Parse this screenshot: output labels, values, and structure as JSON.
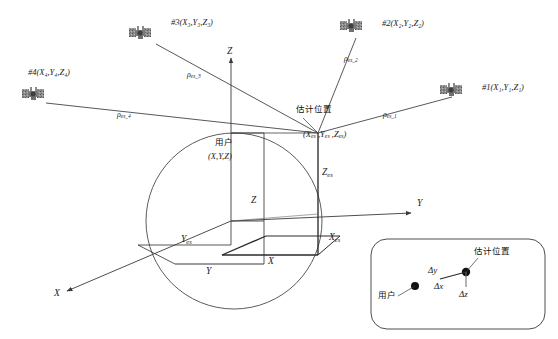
{
  "figure": {
    "type": "diagram",
    "background_color": "#ffffff",
    "line_color": "#3a3a3a"
  },
  "satellites": [
    {
      "id": "sat-1",
      "label": "#1(X₁,Y₁,Z₁)",
      "name": "#1",
      "coords": "(X1,Y1,Z1)",
      "icon": "satellite-icon",
      "x": 452,
      "y": 88,
      "label_x": 482,
      "label_y": 86
    },
    {
      "id": "sat-2",
      "label": "#2(X₂,Y₂,Z₂)",
      "name": "#2",
      "coords": "(X2,Y2,Z2)",
      "icon": "satellite-icon",
      "x": 352,
      "y": 24,
      "label_x": 382,
      "label_y": 22
    },
    {
      "id": "sat-3",
      "label": "#3(X₃,Y₃,Z₃)",
      "name": "#3",
      "coords": "(X3,Y3,Z3)",
      "icon": "satellite-icon",
      "x": 141,
      "y": 31,
      "label_x": 171,
      "label_y": 22
    },
    {
      "id": "sat-4",
      "label": "#4(X₄,Y₄,Z₄)",
      "name": "#4",
      "coords": "(X4,Y4,Z4)",
      "icon": "satellite-icon",
      "x": 33,
      "y": 91,
      "label_x": 30,
      "label_y": 71
    }
  ],
  "ranges": [
    {
      "id": "rho-1",
      "label": "ρ",
      "sub": "es_1",
      "x": 385,
      "y": 114
    },
    {
      "id": "rho-2",
      "label": "ρ",
      "sub": "es_2",
      "x": 345,
      "y": 58
    },
    {
      "id": "rho-3",
      "label": "ρ",
      "sub": "es_3",
      "x": 189,
      "y": 74
    },
    {
      "id": "rho-4",
      "label": "ρ",
      "sub": "es_4",
      "x": 119,
      "y": 114
    }
  ],
  "axes": [
    {
      "id": "axis-z",
      "label": "Z",
      "x": 231,
      "y": 52
    },
    {
      "id": "axis-y",
      "label": "Y",
      "x": 419,
      "y": 204
    },
    {
      "id": "axis-x",
      "label": "X",
      "x": 56,
      "y": 297
    }
  ],
  "labels": {
    "estimated_position_cn": "估计位置",
    "estimated_position_coords": "(X",
    "estimated_position_coords_full": "(Xes ,Yes ,Zes)",
    "user_cn": "用户",
    "user_coords": "(X,Y,Z)",
    "z_true": "Z",
    "y_true": "Y",
    "x_true": "X",
    "z_est": "Z",
    "y_est": "Y",
    "x_est": "X",
    "est_subscript": "es",
    "delta_x": "Δx",
    "delta_y": "Δy",
    "delta_z": "Δz"
  },
  "inset": {
    "id": "detail-inset",
    "user_label_cn": "用户",
    "estimated_label_cn": "估计位置",
    "delta_x": "Δx",
    "delta_y": "Δy",
    "delta_z": "Δz"
  },
  "geometry": {
    "earth_center": [
      234,
      221
    ],
    "earth_radius": 88,
    "origin": [
      231,
      221
    ],
    "estimated_point": [
      318,
      133
    ],
    "user_point": [
      264,
      133
    ]
  }
}
